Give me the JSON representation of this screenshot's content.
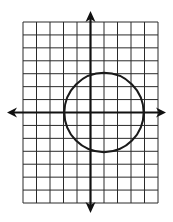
{
  "figure": {
    "type": "coordinate-plane-with-circle",
    "grid": {
      "x_min": -5,
      "x_max": 5,
      "y_min": -7,
      "y_max": 7,
      "columns": 10,
      "rows": 14,
      "line_color": "#2a2a2a",
      "axis_color": "#111111"
    },
    "axes": {
      "x_axis": {
        "arrows": [
          "left",
          "right"
        ]
      },
      "y_axis": {
        "arrows": [
          "up",
          "down"
        ]
      }
    },
    "circle": {
      "center": [
        1,
        0
      ],
      "radius": 3,
      "stroke": "#1a1a1a"
    }
  }
}
